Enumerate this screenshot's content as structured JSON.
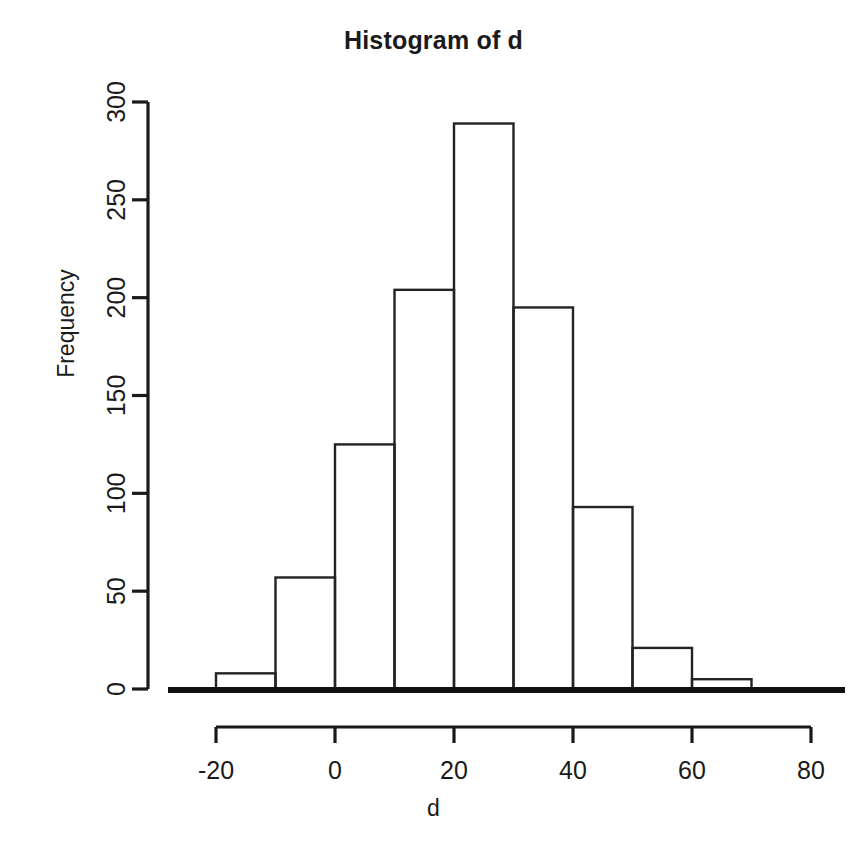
{
  "chart_data": {
    "type": "bar",
    "title": "Histogram of d",
    "xlabel": "d",
    "ylabel": "Frequency",
    "subtitle": "",
    "grid": false,
    "legend": false,
    "legend_position": "none",
    "bin_width": 10,
    "bin_edges": [
      -20,
      -10,
      0,
      10,
      20,
      30,
      40,
      50,
      60,
      70
    ],
    "categories": [
      "-20 to -10",
      "-10 to 0",
      "0 to 10",
      "10 to 20",
      "20 to 30",
      "30 to 40",
      "40 to 50",
      "50 to 60",
      "60 to 70"
    ],
    "bin_centers": [
      -15,
      -5,
      5,
      15,
      25,
      35,
      45,
      55,
      65
    ],
    "values": [
      8,
      57,
      125,
      204,
      289,
      195,
      93,
      21,
      5
    ],
    "xlim": [
      -25,
      80
    ],
    "ylim": [
      0,
      300
    ],
    "xticks": [
      -20,
      0,
      20,
      40,
      60,
      80
    ],
    "xtick_labels": [
      "-20",
      "0",
      "20",
      "40",
      "60",
      "80"
    ],
    "yticks": [
      0,
      50,
      100,
      150,
      200,
      250,
      300
    ],
    "ytick_labels": [
      "0",
      "50",
      "100",
      "150",
      "200",
      "250",
      "300"
    ],
    "bar_fill": "#ffffff",
    "bar_stroke": "#232323",
    "axis_color": "#1a1a1a",
    "background": "#ffffff"
  }
}
